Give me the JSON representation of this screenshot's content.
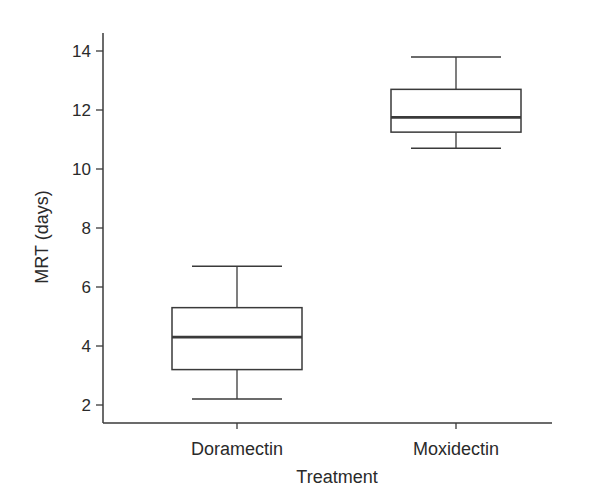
{
  "chart_data": {
    "type": "box",
    "title": "",
    "xlabel": "Treatment",
    "ylabel": "MRT (days)",
    "ylim": [
      1.4,
      14.6
    ],
    "yticks": [
      2,
      4,
      6,
      8,
      10,
      12,
      14
    ],
    "categories": [
      "Doramectin",
      "Moxidectin"
    ],
    "series": [
      {
        "name": "Doramectin",
        "whisker_low": 2.2,
        "q1": 3.2,
        "median": 4.3,
        "q3": 5.3,
        "whisker_high": 6.7
      },
      {
        "name": "Moxidectin",
        "whisker_low": 10.7,
        "q1": 11.25,
        "median": 11.75,
        "q3": 12.7,
        "whisker_high": 13.8
      }
    ],
    "grid": false,
    "legend": null
  },
  "colors": {
    "line": "#3a3a3a",
    "median": "#3a3a3a",
    "background": "#ffffff"
  }
}
